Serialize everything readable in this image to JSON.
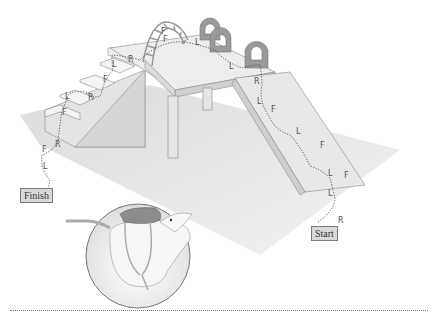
{
  "figure": {
    "labels": {
      "start": "Start",
      "finish": "Finish"
    },
    "legend_letters": {
      "R": "right",
      "L": "left",
      "F": "forward"
    },
    "path_sequence_from_start": [
      "R",
      "L",
      "F",
      "L",
      "F",
      "L",
      "F",
      "L",
      "R",
      "L",
      "L",
      "F",
      "F",
      "R",
      "L",
      "R",
      "F",
      "L",
      "F",
      "R",
      "F",
      "L"
    ],
    "ramp_letters": [
      "R",
      "L",
      "F",
      "L",
      "F",
      "L",
      "F",
      "L",
      "R"
    ],
    "table_letters": [
      "L",
      "L"
    ],
    "stairs_letters": [
      "R",
      "L",
      "F",
      "R",
      "L",
      "F",
      "R"
    ],
    "floor_letters_finish": [
      "F",
      "L"
    ],
    "obstacles": [
      "ramp",
      "table",
      "rings",
      "arched ladder",
      "stairs"
    ],
    "inset": "rat wearing backpack harness"
  },
  "colors": {
    "floor": "#e6e6e6",
    "surfaces": "#ededed",
    "edges": "#8a8a8a",
    "label_bg": "#d9d9d9",
    "backpack": "#8c8c8c"
  }
}
